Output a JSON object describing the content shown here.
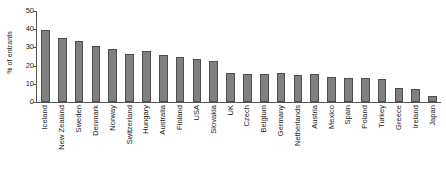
{
  "chart_data": {
    "type": "bar",
    "title": "",
    "xlabel": "",
    "ylabel": "% of entrants",
    "ylim": [
      0,
      50
    ],
    "yticks": [
      0,
      10,
      20,
      30,
      40,
      50
    ],
    "grid": false,
    "legend": null,
    "bar_color": "#808080",
    "bar_edge_color": "#4d4d4d",
    "axis_color": "#555555",
    "categories": [
      "Iceland",
      "New Zealand",
      "Sweden",
      "Denmark",
      "Norway",
      "Switzerland",
      "Hungary",
      "Australia",
      "Finland",
      "USA",
      "Slovakia",
      "UK",
      "Czech",
      "Belgium",
      "Germany",
      "Netherlands",
      "Austria",
      "Mexico",
      "Spain",
      "Poland",
      "Turkey",
      "Greece",
      "Ireland",
      "Japan"
    ],
    "values": [
      39.5,
      35.3,
      33.7,
      30.7,
      29.2,
      26.4,
      28.2,
      25.8,
      24.6,
      23.4,
      22.8,
      16.2,
      15.6,
      15.2,
      16.0,
      14.6,
      15.4,
      13.6,
      13.2,
      13.0,
      12.8,
      7.6,
      7.4,
      3.4
    ]
  }
}
